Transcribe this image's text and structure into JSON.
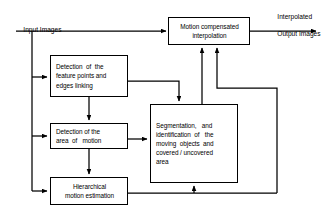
{
  "diagram": {
    "width": 324,
    "height": 222,
    "stroke_color": "#000000",
    "background_color": "#ffffff",
    "type": "flowchart"
  },
  "edge_labels": {
    "input": "Input Images",
    "output_line1": "Interpolated",
    "output_line2": "Output Images"
  },
  "nodes": {
    "motion_compensated": {
      "line1": "Motion compensated",
      "line2": "interpolation"
    },
    "feature_points": {
      "line1": "Detection  of  the",
      "line2": "feature points and",
      "line3": "edges linking"
    },
    "area_of_motion": {
      "line1": "Detection of the",
      "line2": "area  of   motion"
    },
    "hierarchical": {
      "line1": "Hierarchical",
      "line2": "motion estimation"
    },
    "segmentation": {
      "line1": "Segmentation,   and",
      "line2": "identification  of   the",
      "line3": "moving  objects  and",
      "line4": "covered / uncovered",
      "line5": "area"
    }
  },
  "connections": [
    {
      "from": "input",
      "to": "motion_compensated"
    },
    {
      "from": "input",
      "to": "feature_points"
    },
    {
      "from": "input",
      "to": "area_of_motion"
    },
    {
      "from": "input",
      "to": "hierarchical"
    },
    {
      "from": "feature_points",
      "to": "area_of_motion"
    },
    {
      "from": "feature_points",
      "to": "segmentation"
    },
    {
      "from": "area_of_motion",
      "to": "hierarchical"
    },
    {
      "from": "area_of_motion",
      "to": "segmentation"
    },
    {
      "from": "hierarchical",
      "to": "segmentation"
    },
    {
      "from": "hierarchical",
      "to": "motion_compensated"
    },
    {
      "from": "segmentation",
      "to": "motion_compensated"
    },
    {
      "from": "motion_compensated",
      "to": "output"
    }
  ]
}
